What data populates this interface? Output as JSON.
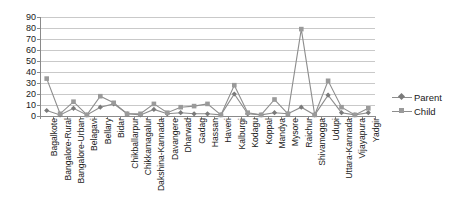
{
  "chart_data": {
    "type": "line",
    "title": "",
    "xlabel": "",
    "ylabel": "",
    "ylim": [
      0,
      90
    ],
    "ytick_step": 10,
    "yticks": [
      0,
      10,
      20,
      30,
      40,
      50,
      60,
      70,
      80,
      90
    ],
    "grid": true,
    "legend_position": "right",
    "categories": [
      "Bagalkote",
      "Bangalore-Rural",
      "Bangalore-Urban",
      "Belagavi",
      "Bellary",
      "Bidar",
      "Chikballarpur",
      "Chikkamagalur",
      "Dakshina-Kannada",
      "Davangere",
      "Dharwad",
      "Gadag",
      "Hassan",
      "Haveri",
      "Kalburgi",
      "Kodagu",
      "Koppal",
      "Mandya",
      "Mysore",
      "Raichur",
      "Shivamogga",
      "Udupi",
      "Uttara-Kannada",
      "Vijayapura",
      "Yadgir"
    ],
    "series": [
      {
        "name": "Parent",
        "marker": "diamond",
        "color": "#7a7a7a",
        "values": [
          5,
          1,
          7,
          1,
          8,
          11,
          2,
          1,
          6,
          2,
          3,
          2,
          2,
          1,
          20,
          2,
          1,
          3,
          2,
          8,
          1,
          19,
          3,
          1,
          3
        ]
      },
      {
        "name": "Child",
        "marker": "square",
        "color": "#9a9a9a",
        "values": [
          34,
          2,
          13,
          1,
          18,
          12,
          2,
          2,
          11,
          3,
          8,
          9,
          11,
          1,
          28,
          3,
          1,
          15,
          2,
          79,
          1,
          32,
          8,
          1,
          7
        ]
      }
    ]
  },
  "legend": {
    "items": [
      {
        "label": "Parent",
        "marker": "diamond-marker"
      },
      {
        "label": "Child",
        "marker": "square-marker"
      }
    ]
  }
}
